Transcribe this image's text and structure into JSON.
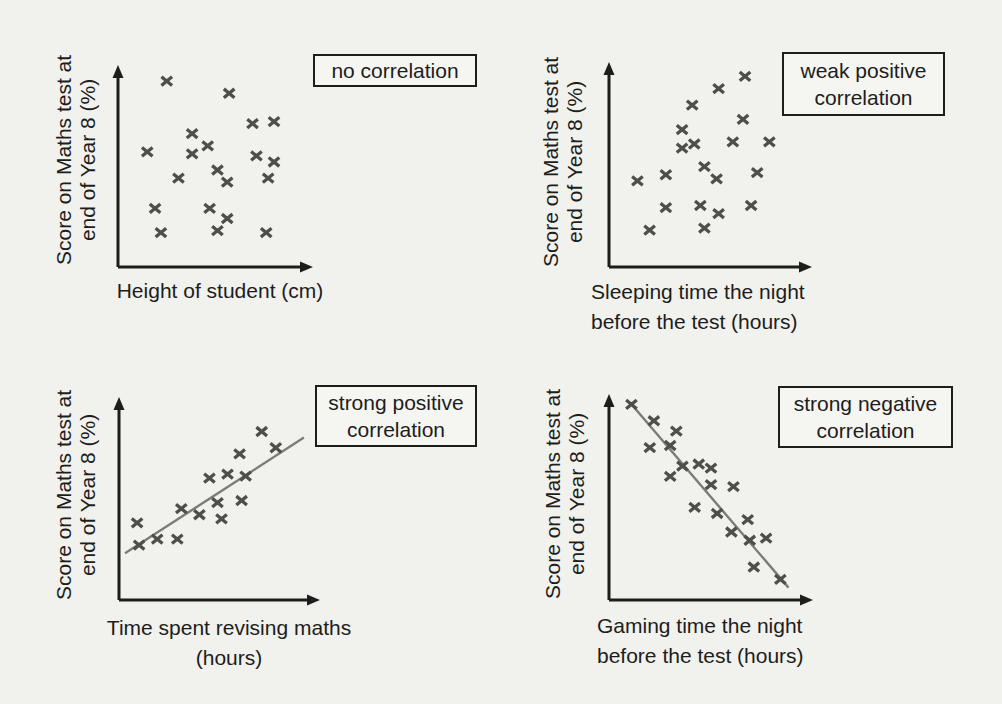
{
  "page": {
    "background": "#f1f1ee"
  },
  "colors": {
    "axis": "#1d1d1b",
    "text": "#1d1d1b",
    "marker": "#4e4e4c",
    "trend": "#7b7b79",
    "box_background": "#f5f5f2",
    "box_border": "#1d1d1b"
  },
  "y_axis_label": {
    "line1": "Score on Maths test at",
    "line2": "end of Year 8 (%)"
  },
  "chart_data": [
    {
      "id": "no-correlation",
      "type": "scatter",
      "annotation_lines": [
        "no correlation"
      ],
      "xlabel_lines": [
        "Height of student (cm)"
      ],
      "ylabel": "Score on Maths test at end of Year 8 (%)",
      "axes_note": "no ticks or numeric labels; point coordinates normalized 0-100 along drawn axes",
      "points": [
        [
          25,
          92
        ],
        [
          57,
          86
        ],
        [
          69,
          71
        ],
        [
          80,
          72
        ],
        [
          38,
          66
        ],
        [
          15,
          57
        ],
        [
          46,
          60
        ],
        [
          38,
          56
        ],
        [
          71,
          55
        ],
        [
          80,
          52
        ],
        [
          51,
          48
        ],
        [
          31,
          44
        ],
        [
          56,
          42
        ],
        [
          77,
          44
        ],
        [
          19,
          29
        ],
        [
          47,
          29
        ],
        [
          56,
          24
        ],
        [
          22,
          17
        ],
        [
          51,
          18
        ],
        [
          76,
          17
        ]
      ],
      "trend_line": null
    },
    {
      "id": "weak-positive-correlation",
      "type": "scatter",
      "annotation_lines": [
        "weak positive",
        "correlation"
      ],
      "xlabel_lines": [
        "Sleeping time the night",
        "before the test (hours)"
      ],
      "ylabel": "Score on Maths test at end of Year 8 (%)",
      "axes_note": "no ticks or numeric labels; point coordinates normalized 0-100 along drawn axes",
      "points": [
        [
          67,
          93
        ],
        [
          54,
          87
        ],
        [
          41,
          79
        ],
        [
          66,
          72
        ],
        [
          36,
          67
        ],
        [
          42,
          60
        ],
        [
          61,
          61
        ],
        [
          79,
          61
        ],
        [
          36,
          58
        ],
        [
          47,
          49
        ],
        [
          28,
          45
        ],
        [
          14,
          42
        ],
        [
          53,
          43
        ],
        [
          73,
          46
        ],
        [
          28,
          29
        ],
        [
          45,
          30
        ],
        [
          54,
          26
        ],
        [
          70,
          30
        ],
        [
          20,
          18
        ],
        [
          47,
          19
        ]
      ],
      "trend_line": null
    },
    {
      "id": "strong-positive-correlation",
      "type": "scatter",
      "annotation_lines": [
        "strong positive",
        "correlation"
      ],
      "xlabel_lines": [
        "Time spent revising maths",
        "(hours)"
      ],
      "ylabel": "Score on Maths test at end of Year 8 (%)",
      "axes_note": "no ticks or numeric labels; point coordinates normalized 0-100 along drawn axes",
      "points": [
        [
          71,
          83
        ],
        [
          78,
          75
        ],
        [
          60,
          72
        ],
        [
          54,
          62
        ],
        [
          45,
          60
        ],
        [
          63,
          61
        ],
        [
          49,
          48
        ],
        [
          61,
          49
        ],
        [
          31,
          45
        ],
        [
          40,
          42
        ],
        [
          51,
          40
        ],
        [
          9,
          38
        ],
        [
          19,
          30
        ],
        [
          29,
          30
        ],
        [
          10,
          27
        ]
      ],
      "trend_line": [
        [
          3,
          23
        ],
        [
          92,
          80
        ]
      ]
    },
    {
      "id": "strong-negative-correlation",
      "type": "scatter",
      "annotation_lines": [
        "strong negative",
        "correlation"
      ],
      "xlabel_lines": [
        "Gaming time the night",
        "before the test (hours)"
      ],
      "ylabel": "Score on Maths test at end of Year 8 (%)",
      "axes_note": "no ticks or numeric labels; point coordinates normalized 0-100 along drawn axes",
      "points": [
        [
          11,
          95
        ],
        [
          22,
          87
        ],
        [
          33,
          82
        ],
        [
          20,
          74
        ],
        [
          30,
          75
        ],
        [
          36,
          65
        ],
        [
          44,
          66
        ],
        [
          50,
          64
        ],
        [
          30,
          60
        ],
        [
          50,
          56
        ],
        [
          61,
          55
        ],
        [
          42,
          45
        ],
        [
          53,
          42
        ],
        [
          68,
          39
        ],
        [
          60,
          33
        ],
        [
          77,
          30
        ],
        [
          69,
          29
        ],
        [
          71,
          16
        ],
        [
          84,
          10
        ]
      ],
      "trend_line": [
        [
          11,
          95
        ],
        [
          88,
          6
        ]
      ]
    }
  ]
}
